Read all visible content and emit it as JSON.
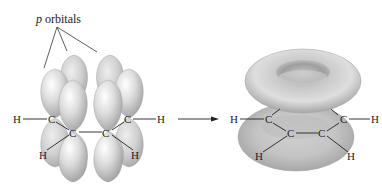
{
  "diagram": {
    "label": {
      "italic": "p",
      "text": " orbitals"
    },
    "left_molecule": {
      "atoms": {
        "h_left": "H",
        "c1": "C",
        "c2": "C",
        "c3": "C",
        "c4": "C",
        "h_right": "H",
        "h_bl": "H",
        "h_br": "H"
      }
    },
    "right_molecule": {
      "atoms": {
        "h_left": "H",
        "c1": "C",
        "c2": "C",
        "c3": "C",
        "c4": "C",
        "h_right": "H",
        "h_bl": "H",
        "h_br": "H"
      }
    },
    "arrow": "reaction-arrow",
    "colors": {
      "orbital_light": "#f2f2f2",
      "orbital_mid": "#c8c8c8",
      "orbital_dark": "#9a9a9a",
      "bond": "#222222",
      "background": "#ffffff"
    }
  }
}
